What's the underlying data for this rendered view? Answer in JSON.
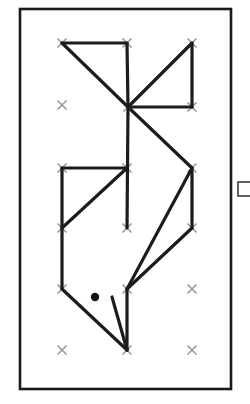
{
  "figure": {
    "title": "Line drawing puzzle on dot grid",
    "background_color": "#ffffff",
    "width": 250,
    "height": 404
  },
  "frame": {
    "name": "outer-border",
    "x": 20,
    "y": 9,
    "width": 211,
    "height": 380,
    "stroke_color": "#1a1a1a",
    "stroke_width": 2.6
  },
  "side_marker": {
    "name": "edge-rectangle",
    "x": 238,
    "y": 182,
    "width": 14,
    "height": 14,
    "stroke_color": "#3a3a3a",
    "stroke_width": 1.6
  },
  "grid": {
    "columns_x": [
      62,
      127,
      192
    ],
    "rows_y": [
      43,
      105,
      168,
      228,
      289,
      350
    ],
    "mark_glyph": "x-mark",
    "mark_color": "#9a9a9a",
    "mark_size": 9,
    "mark_stroke_width": 1.6,
    "points": [
      {
        "col": 0,
        "row": 0,
        "x": 62,
        "y": 43
      },
      {
        "col": 1,
        "row": 0,
        "x": 127,
        "y": 43
      },
      {
        "col": 2,
        "row": 0,
        "x": 192,
        "y": 43
      },
      {
        "col": 0,
        "row": 1,
        "x": 62,
        "y": 105
      },
      {
        "col": 1,
        "row": 1,
        "x": 128,
        "y": 107
      },
      {
        "col": 2,
        "row": 1,
        "x": 192,
        "y": 107
      },
      {
        "col": 0,
        "row": 2,
        "x": 62,
        "y": 168
      },
      {
        "col": 1,
        "row": 2,
        "x": 127,
        "y": 168
      },
      {
        "col": 2,
        "row": 2,
        "x": 192,
        "y": 168
      },
      {
        "col": 0,
        "row": 3,
        "x": 62,
        "y": 228
      },
      {
        "col": 1,
        "row": 3,
        "x": 127,
        "y": 228
      },
      {
        "col": 2,
        "row": 3,
        "x": 192,
        "y": 228
      },
      {
        "col": 0,
        "row": 4,
        "x": 62,
        "y": 289
      },
      {
        "col": 1,
        "row": 4,
        "x": 127,
        "y": 289
      },
      {
        "col": 2,
        "row": 4,
        "x": 192,
        "y": 289
      },
      {
        "col": 0,
        "row": 5,
        "x": 62,
        "y": 350
      },
      {
        "col": 1,
        "row": 5,
        "x": 127,
        "y": 350
      },
      {
        "col": 2,
        "row": 5,
        "x": 192,
        "y": 350
      }
    ]
  },
  "marker_dot": {
    "name": "filled-dot",
    "x": 95,
    "y": 297,
    "radius": 4.2,
    "fill_color": "#121212"
  },
  "drawing": {
    "stroke_color": "#1c1c1c",
    "stroke_width": 3.2,
    "segments": [
      {
        "id": "seg-top-horizontal",
        "x1": 62,
        "y1": 43,
        "x2": 127,
        "y2": 43
      },
      {
        "id": "seg-topleft-to-hub",
        "x1": 62,
        "y1": 43,
        "x2": 128,
        "y2": 107
      },
      {
        "id": "seg-topmid-vertical",
        "x1": 127,
        "y1": 43,
        "x2": 128,
        "y2": 107
      },
      {
        "id": "seg-hub-to-topright",
        "x1": 128,
        "y1": 107,
        "x2": 192,
        "y2": 43
      },
      {
        "id": "seg-topright-vertical",
        "x1": 192,
        "y1": 43,
        "x2": 192,
        "y2": 107
      },
      {
        "id": "seg-hub-horizontal-right",
        "x1": 128,
        "y1": 107,
        "x2": 192,
        "y2": 107
      },
      {
        "id": "seg-hub-vertical-down",
        "x1": 128,
        "y1": 107,
        "x2": 127,
        "y2": 228
      },
      {
        "id": "seg-hub-to-midright",
        "x1": 128,
        "y1": 107,
        "x2": 192,
        "y2": 168
      },
      {
        "id": "seg-midleft-horizontal",
        "x1": 62,
        "y1": 168,
        "x2": 127,
        "y2": 168
      },
      {
        "id": "seg-midleft-vertical",
        "x1": 62,
        "y1": 168,
        "x2": 62,
        "y2": 289
      },
      {
        "id": "seg-midleft-diagonal",
        "x1": 62,
        "y1": 228,
        "x2": 127,
        "y2": 168
      },
      {
        "id": "seg-midright-vertical",
        "x1": 192,
        "y1": 168,
        "x2": 192,
        "y2": 228
      },
      {
        "id": "seg-midright-to-bottom",
        "x1": 192,
        "y1": 168,
        "x2": 127,
        "y2": 289
      },
      {
        "id": "seg-lowright-to-bottom",
        "x1": 192,
        "y1": 228,
        "x2": 127,
        "y2": 289
      },
      {
        "id": "seg-lowleft-to-base",
        "x1": 62,
        "y1": 289,
        "x2": 127,
        "y2": 350
      },
      {
        "id": "seg-base-vertical",
        "x1": 127,
        "y1": 289,
        "x2": 127,
        "y2": 350
      },
      {
        "id": "seg-short-diagonal-to-base",
        "x1": 112,
        "y1": 297,
        "x2": 127,
        "y2": 350
      }
    ]
  }
}
